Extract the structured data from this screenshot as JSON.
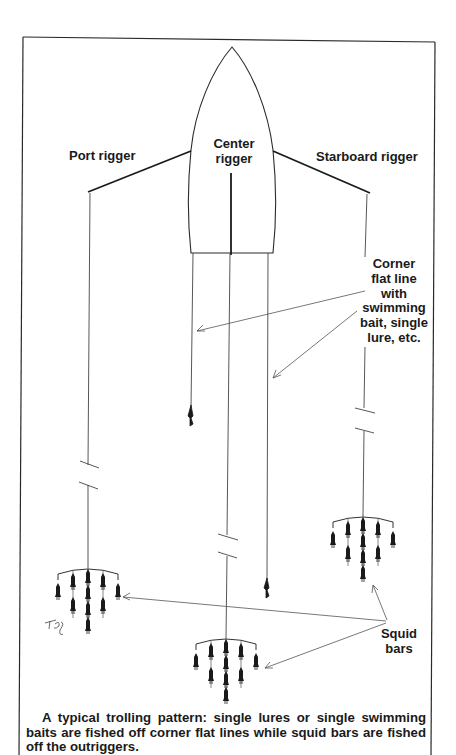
{
  "figure": {
    "type": "illustration",
    "subject": "trolling pattern",
    "labels": {
      "port_rigger": "Port rigger",
      "center_rigger_line1": "Center",
      "center_rigger_line2": "rigger",
      "starboard_rigger": "Starboard rigger",
      "corner_flat_line": [
        "Corner",
        "flat line",
        "with",
        "swimming",
        "bait, single",
        "lure, etc."
      ],
      "squid_bars": [
        "Squid",
        "bars"
      ]
    },
    "signature": "TBJ",
    "caption": "A typical trolling pattern: single lures or single swimming baits are fished off corner flat lines while squid bars are fished off the outriggers.",
    "colors": {
      "ink": "#1a1a1a",
      "line": "#333333",
      "background": "#ffffff"
    }
  }
}
